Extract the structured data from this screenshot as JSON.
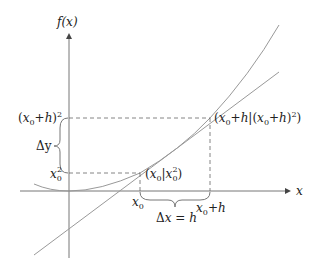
{
  "diagram": {
    "axes": {
      "y_label": "f(x)",
      "x_label": "x"
    },
    "y_ticks": {
      "upper": "(x0+h)²",
      "lower": "x0²",
      "upper_base": "(x",
      "upper_sub": "0",
      "upper_tail": "+h)",
      "upper_sup": "2",
      "lower_base": "x",
      "lower_sub": "0",
      "lower_sup": "2"
    },
    "x_ticks": {
      "left_base": "x",
      "left_sub": "0",
      "right_base": "x",
      "right_sub": "0",
      "right_tail": "+h"
    },
    "braces": {
      "vertical_label": "Δy",
      "horizontal_label_pre": "Δ",
      "horizontal_label_var": "x",
      "horizontal_label_post": " = h"
    },
    "points": {
      "p1": "(x0|x0²)",
      "p2": "(x0+h|(x0+h)²)"
    },
    "colors": {
      "axis": "#777777",
      "curve": "#999999",
      "dash": "#666666",
      "text": "#222222"
    }
  }
}
